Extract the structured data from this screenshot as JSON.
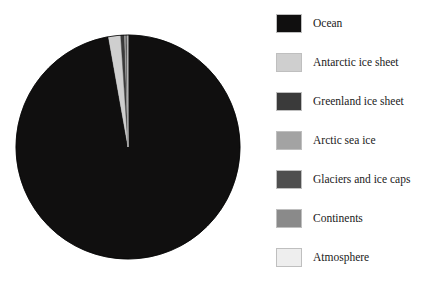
{
  "chart_data": {
    "type": "pie",
    "title": "",
    "subtitle": "",
    "xlabel": "",
    "ylabel": "",
    "grid": false,
    "legend_position": "right",
    "start_angle_deg": 0,
    "direction": "clockwise",
    "categories": [
      "Ocean",
      "Antarctic ice sheet",
      "Greenland ice sheet",
      "Arctic sea ice",
      "Glaciers and ice caps",
      "Continents",
      "Atmosphere"
    ],
    "values": [
      97.2,
      1.75,
      0.55,
      0.18,
      0.16,
      0.15,
      0.01
    ],
    "units": "percent",
    "colors": [
      "#100f0f",
      "#cfcfcf",
      "#3a3a3a",
      "#a3a3a3",
      "#4f4f4f",
      "#8a8a8a",
      "#eeeeee"
    ],
    "slices": [
      {
        "label": "Ocean",
        "value": 97.2,
        "color": "#100f0f"
      },
      {
        "label": "Antarctic ice sheet",
        "value": 1.75,
        "color": "#cfcfcf"
      },
      {
        "label": "Greenland ice sheet",
        "value": 0.55,
        "color": "#3a3a3a"
      },
      {
        "label": "Arctic sea ice",
        "value": 0.18,
        "color": "#a3a3a3"
      },
      {
        "label": "Glaciers and ice caps",
        "value": 0.16,
        "color": "#4f4f4f"
      },
      {
        "label": "Continents",
        "value": 0.15,
        "color": "#8a8a8a"
      },
      {
        "label": "Atmosphere",
        "value": 0.01,
        "color": "#eeeeee"
      }
    ]
  },
  "pie": {
    "center_x": 128,
    "center_y": 147,
    "radius": 112,
    "outline_color": "#000000"
  },
  "legend": {
    "items": [
      {
        "label": "Ocean",
        "color": "#100f0f"
      },
      {
        "label": "Antarctic ice sheet",
        "color": "#cfcfcf"
      },
      {
        "label": "Greenland ice sheet",
        "color": "#3a3a3a"
      },
      {
        "label": "Arctic sea ice",
        "color": "#a3a3a3"
      },
      {
        "label": "Glaciers and ice caps",
        "color": "#4f4f4f"
      },
      {
        "label": "Continents",
        "color": "#8a8a8a"
      },
      {
        "label": "Atmosphere",
        "color": "#eeeeee"
      }
    ]
  }
}
